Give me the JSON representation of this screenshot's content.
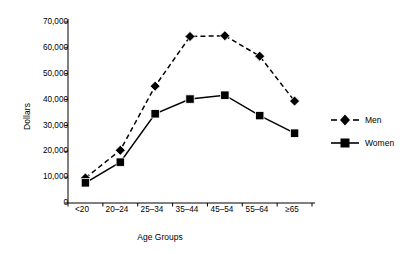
{
  "chart_data": {
    "type": "line",
    "title": "",
    "xlabel": "Age Groups",
    "ylabel": "Dollars",
    "categories": [
      "<20",
      "20–24",
      "25–34",
      "35–44",
      "45–54",
      "55–64",
      "≥65"
    ],
    "yticks": [
      "0",
      "10,000",
      "20,000",
      "30,000",
      "40,000",
      "50,000",
      "60,000",
      "70,000"
    ],
    "ytick_values": [
      0,
      10000,
      20000,
      30000,
      40000,
      50000,
      60000,
      70000
    ],
    "ylim": [
      0,
      70000
    ],
    "grid": false,
    "legend_position": "right",
    "series": [
      {
        "name": "Men",
        "marker": "diamond",
        "linestyle": "dashed",
        "color": "#000000",
        "values": [
          9700,
          20400,
          45200,
          64400,
          64700,
          56800,
          39400
        ]
      },
      {
        "name": "Women",
        "marker": "square",
        "linestyle": "solid",
        "color": "#000000",
        "values": [
          7800,
          15800,
          34500,
          40200,
          41700,
          33800,
          27000
        ]
      }
    ]
  },
  "legend": {
    "items": [
      {
        "label": "Men"
      },
      {
        "label": "Women"
      }
    ]
  }
}
